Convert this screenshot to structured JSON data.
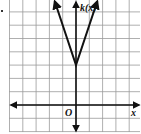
{
  "chart_data": {
    "type": "line",
    "title": "",
    "function_label": "k(x)",
    "xlabel": "x",
    "ylabel": "k(x)",
    "origin_label": "O",
    "grid": true,
    "xlim": [
      -5,
      5
    ],
    "ylim": [
      -2,
      8
    ],
    "series": [
      {
        "name": "k(x)",
        "description": "absolute value function opening upward, vertex at (0,3), slope 3",
        "x": [
          -1.6,
          0,
          1.6
        ],
        "y": [
          7.8,
          3,
          7.8
        ],
        "arrows": "both ends"
      }
    ],
    "vertex": [
      0,
      3
    ]
  },
  "labels": {
    "y_axis": "k(x)",
    "x_axis": "x",
    "origin": "O"
  }
}
